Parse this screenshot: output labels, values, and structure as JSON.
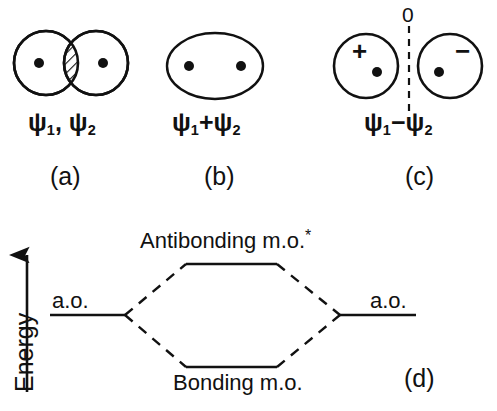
{
  "figure": {
    "type": "molecular-orbital-formation-diagram",
    "background_color": "#ffffff",
    "ink_color": "#111111"
  },
  "panels": [
    {
      "id": "a",
      "caption": "(a)",
      "formula": "ψ₁, ψ₂",
      "psi_parts": {
        "first_symbol": "ψ",
        "first_sub": "1",
        "separator": ", ",
        "second_symbol": "ψ",
        "second_sub": "2"
      },
      "description": "two overlapping atomic orbitals with hatched overlap region",
      "nuclei_count": 2
    },
    {
      "id": "b",
      "caption": "(b)",
      "formula": "ψ₁+ψ₂",
      "psi_parts": {
        "first_symbol": "ψ",
        "first_sub": "1",
        "separator": "+",
        "second_symbol": "ψ",
        "second_sub": "2"
      },
      "description": "single merged ellipse bonding orbital with two nuclei",
      "nuclei_count": 2
    },
    {
      "id": "c",
      "caption": "(c)",
      "formula": "ψ₁−ψ₂",
      "psi_parts": {
        "first_symbol": "ψ",
        "first_sub": "1",
        "separator": "−",
        "second_symbol": "ψ",
        "second_sub": "2"
      },
      "description": "two lobes of opposite sign separated by a dashed nodal plane",
      "nuclei_count": 2,
      "node_label": "0",
      "left_lobe_sign": "+",
      "right_lobe_sign": "−"
    },
    {
      "id": "d",
      "caption": "(d)",
      "description": "energy level correlation diagram"
    }
  ],
  "energy_diagram": {
    "axis_label": "Energy",
    "axis_direction": "up",
    "left_level_label": "a.o.",
    "right_level_label": "a.o.",
    "antibonding_label": "Antibonding m.o.",
    "antibonding_superscript": "*",
    "bonding_label": "Bonding m.o."
  }
}
